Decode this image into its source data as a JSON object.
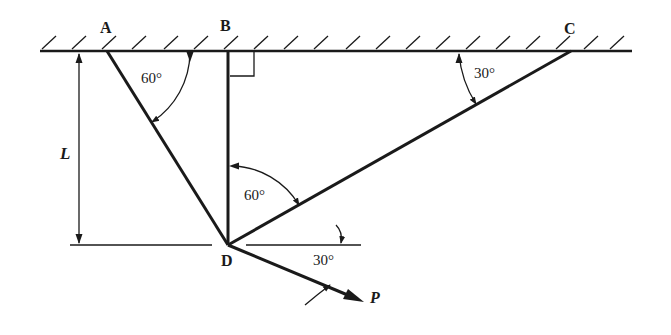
{
  "diagram": {
    "points": {
      "A": {
        "label": "A",
        "x": 107,
        "y": 51
      },
      "B": {
        "label": "B",
        "x": 228,
        "y": 51
      },
      "C": {
        "label": "C",
        "x": 571,
        "y": 51
      },
      "D": {
        "label": "D",
        "x": 228,
        "y": 245
      }
    },
    "labels": {
      "A": "A",
      "B": "B",
      "C": "C",
      "D": "D",
      "L": "L",
      "P": "P",
      "angle_AD": "60°",
      "angle_BD_CD": "60°",
      "angle_C": "30°",
      "angle_P": "30°"
    },
    "members": [
      {
        "name": "AD",
        "from": "A",
        "to": "D"
      },
      {
        "name": "BD",
        "from": "B",
        "to": "D"
      },
      {
        "name": "CD",
        "from": "C",
        "to": "D"
      }
    ],
    "load": {
      "name": "P",
      "angle_below_horizontal_deg": 30
    },
    "dimension": {
      "name": "L",
      "description": "height of D below ceiling"
    },
    "colors": {
      "ink": "#1a1a1a",
      "background": "#ffffff"
    }
  }
}
